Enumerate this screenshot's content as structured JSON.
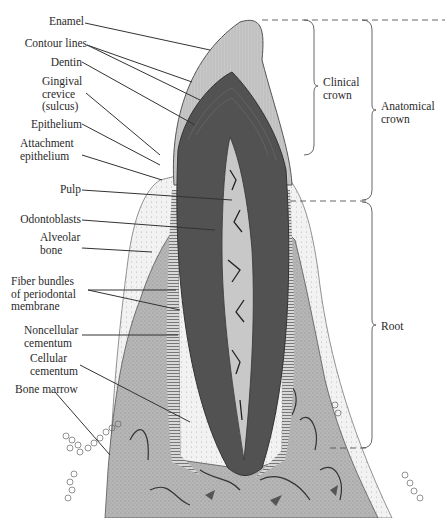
{
  "diagram": {
    "title": "",
    "colors": {
      "background": "#ffffff",
      "enamel": "#c4c4c4",
      "dentin": "#545454",
      "pulp": "#bdbdbd",
      "bone": "#b4b4b4",
      "gingiva": "#ededed",
      "line": "#333333",
      "label_text": "#2a2a2a"
    },
    "left_labels": [
      {
        "id": "enamel",
        "text": "Enamel"
      },
      {
        "id": "contour-lines",
        "text": "Contour lines"
      },
      {
        "id": "dentin",
        "text": "Dentin"
      },
      {
        "id": "gingival-crevice",
        "text": "Gingival\ncrevice\n(sulcus)"
      },
      {
        "id": "epithelium",
        "text": "Epithelium"
      },
      {
        "id": "attachment-epithelium",
        "text": "Attachment\nepithelium"
      },
      {
        "id": "pulp",
        "text": "Pulp"
      },
      {
        "id": "odontoblasts",
        "text": "Odontoblasts"
      },
      {
        "id": "alveolar-bone",
        "text": "Alveolar\nbone"
      },
      {
        "id": "fiber-bundles",
        "text": "Fiber bundles\nof periodontal\nmembrane"
      },
      {
        "id": "noncellular-cementum",
        "text": "Noncellular\ncementum"
      },
      {
        "id": "cellular-cementum",
        "text": "Cellular\ncementum"
      },
      {
        "id": "bone-marrow",
        "text": "Bone marrow"
      }
    ],
    "right_labels": [
      {
        "id": "clinical-crown",
        "text": "Clinical\ncrown"
      },
      {
        "id": "anatomical-crown",
        "text": "Anatomical\ncrown"
      },
      {
        "id": "root",
        "text": "Root"
      }
    ]
  }
}
